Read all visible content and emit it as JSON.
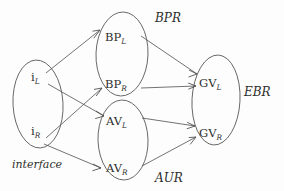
{
  "diagram": {
    "type": "node-graph",
    "title_visible": false,
    "background_color": "#fdfdfd",
    "stroke_color": "#5a5a58",
    "text_color": "#2e2e2c",
    "groups": [
      {
        "id": "interface",
        "label": "interface",
        "label_style": "italic",
        "label_position": "below-left",
        "label_x": 14,
        "label_y": 166,
        "ellipse": {
          "cx": 38,
          "cy": 104,
          "rx": 25,
          "ry": 44
        },
        "nodes": [
          {
            "id": "iL",
            "base": "i",
            "subscript": "L",
            "x": 31,
            "y": 81
          },
          {
            "id": "iR",
            "base": "i",
            "subscript": "R",
            "x": 31,
            "y": 135
          }
        ]
      },
      {
        "id": "BPR",
        "label": "BPR",
        "label_style": "italic",
        "label_position": "upper-right",
        "label_x": 155,
        "label_y": 22,
        "ellipse": {
          "cx": 122,
          "cy": 54,
          "rx": 26,
          "ry": 42
        },
        "nodes": [
          {
            "id": "BPL",
            "base": "BP",
            "subscript": "L",
            "x": 107,
            "y": 37
          },
          {
            "id": "BPR_node",
            "base": "BP",
            "subscript": "R",
            "x": 107,
            "y": 84
          }
        ]
      },
      {
        "id": "AUR",
        "label": "AUR",
        "label_style": "italic",
        "label_position": "below-right",
        "label_x": 155,
        "label_y": 180,
        "ellipse": {
          "cx": 123,
          "cy": 140,
          "rx": 25,
          "ry": 40
        },
        "nodes": [
          {
            "id": "AVL",
            "base": "AV",
            "subscript": "L",
            "x": 108,
            "y": 121
          },
          {
            "id": "AVR",
            "base": "AV",
            "subscript": "R",
            "x": 108,
            "y": 168
          }
        ]
      },
      {
        "id": "EBR",
        "label": "EBR",
        "label_style": "italic",
        "label_position": "right",
        "label_x": 244,
        "label_y": 95,
        "ellipse": {
          "cx": 216,
          "cy": 100,
          "rx": 24,
          "ry": 45
        },
        "nodes": [
          {
            "id": "GVL",
            "base": "GV",
            "subscript": "L",
            "x": 201,
            "y": 83
          },
          {
            "id": "GVR",
            "base": "GV",
            "subscript": "R",
            "x": 201,
            "y": 133
          }
        ]
      }
    ],
    "edges": [
      {
        "id": "iL-to-BPL",
        "from": "iL",
        "to": "BPL",
        "x1": 46,
        "y1": 73,
        "x2": 100,
        "y2": 30
      },
      {
        "id": "iL-to-AVL",
        "from": "iL",
        "to": "AVL",
        "x1": 48,
        "y1": 84,
        "x2": 104,
        "y2": 116
      },
      {
        "id": "iR-to-BPR",
        "from": "iR",
        "to": "BPR_node",
        "x1": 46,
        "y1": 138,
        "x2": 102,
        "y2": 88
      },
      {
        "id": "iR-to-AVR",
        "from": "iR",
        "to": "AVR",
        "x1": 44,
        "y1": 144,
        "x2": 101,
        "y2": 168
      },
      {
        "id": "BPL-to-GVL",
        "from": "BPL",
        "to": "GVL",
        "x1": 141,
        "y1": 36,
        "x2": 197,
        "y2": 74
      },
      {
        "id": "BPR-to-GVL",
        "from": "BPR_node",
        "to": "GVL",
        "x1": 141,
        "y1": 88,
        "x2": 196,
        "y2": 86
      },
      {
        "id": "AVL-to-GVR",
        "from": "AVL",
        "to": "GVR",
        "x1": 142,
        "y1": 118,
        "x2": 195,
        "y2": 126
      },
      {
        "id": "AVR-to-GVR",
        "from": "AVR",
        "to": "GVR",
        "x1": 142,
        "y1": 166,
        "x2": 196,
        "y2": 137
      }
    ]
  }
}
